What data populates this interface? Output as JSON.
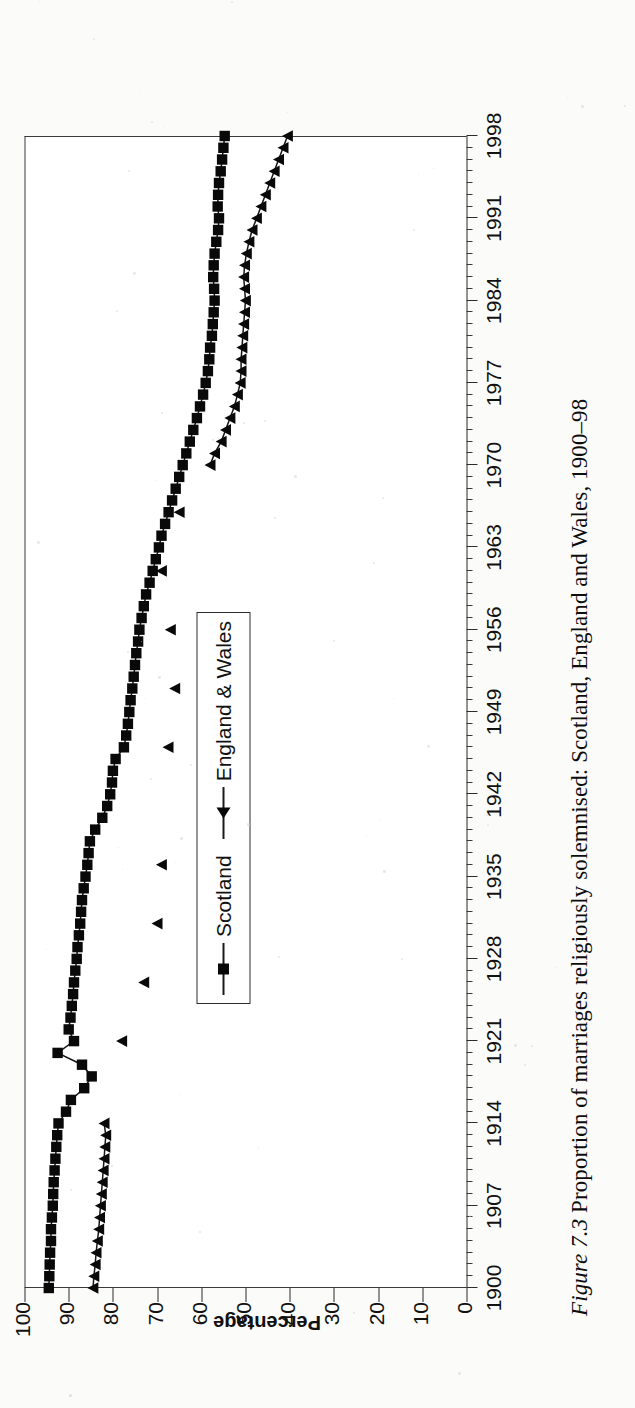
{
  "caption": {
    "figure_label": "Figure 7.3",
    "text": "Proportion of marriages religiously solemnised: Scotland, England and Wales, 1900–98"
  },
  "legend": {
    "position": "inside-center",
    "items": [
      {
        "label": "Scotland",
        "marker": "square-marker"
      },
      {
        "label": "England & Wales",
        "marker": "triangle-marker"
      }
    ]
  },
  "axes": {
    "y_title": "Percentage",
    "y_ticks": [
      "0",
      "10",
      "20",
      "30",
      "40",
      "50",
      "60",
      "70",
      "80",
      "90",
      "100"
    ],
    "x_ticks": [
      "1900",
      "1907",
      "1914",
      "1921",
      "1928",
      "1935",
      "1942",
      "1949",
      "1956",
      "1963",
      "1970",
      "1977",
      "1984",
      "1991",
      "1998"
    ]
  },
  "chart_data": {
    "type": "line",
    "title": "Proportion of marriages religiously solemnised: Scotland, England and Wales, 1900–98",
    "xlabel": "",
    "ylabel": "Percentage",
    "xlim": [
      1900,
      1998
    ],
    "ylim": [
      0,
      100
    ],
    "grid": false,
    "legend_position": "inside-center",
    "x_major_ticks": [
      1900,
      1907,
      1914,
      1921,
      1928,
      1935,
      1942,
      1949,
      1956,
      1963,
      1970,
      1977,
      1984,
      1991,
      1998
    ],
    "x_minor_tick_interval": 1,
    "y_ticks": [
      0,
      10,
      20,
      30,
      40,
      50,
      60,
      70,
      80,
      90,
      100
    ],
    "series": [
      {
        "name": "Scotland",
        "marker": "square",
        "points": [
          [
            1900,
            94.5
          ],
          [
            1901,
            94.4
          ],
          [
            1902,
            94.3
          ],
          [
            1903,
            94.2
          ],
          [
            1904,
            94.0
          ],
          [
            1905,
            94.0
          ],
          [
            1906,
            93.8
          ],
          [
            1907,
            93.6
          ],
          [
            1908,
            93.5
          ],
          [
            1909,
            93.4
          ],
          [
            1910,
            93.2
          ],
          [
            1911,
            93.0
          ],
          [
            1912,
            92.8
          ],
          [
            1913,
            92.6
          ],
          [
            1914,
            92.3
          ],
          [
            1915,
            90.6
          ],
          [
            1916,
            89.5
          ],
          [
            1917,
            86.5
          ],
          [
            1918,
            84.8
          ],
          [
            1919,
            87.0
          ],
          [
            1920,
            92.5
          ],
          [
            1921,
            88.8
          ],
          [
            1922,
            90.0
          ],
          [
            1923,
            89.6
          ],
          [
            1924,
            89.3
          ],
          [
            1925,
            89.0
          ],
          [
            1926,
            88.8
          ],
          [
            1927,
            88.5
          ],
          [
            1928,
            88.2
          ],
          [
            1929,
            88.0
          ],
          [
            1930,
            87.7
          ],
          [
            1931,
            87.4
          ],
          [
            1932,
            87.2
          ],
          [
            1933,
            87.0
          ],
          [
            1934,
            86.6
          ],
          [
            1935,
            86.2
          ],
          [
            1936,
            85.8
          ],
          [
            1937,
            85.5
          ],
          [
            1938,
            85.2
          ],
          [
            1939,
            84.0
          ],
          [
            1940,
            82.4
          ],
          [
            1941,
            81.3
          ],
          [
            1942,
            80.6
          ],
          [
            1943,
            80.2
          ],
          [
            1944,
            80.0
          ],
          [
            1945,
            79.4
          ],
          [
            1946,
            77.5
          ],
          [
            1947,
            77.0
          ],
          [
            1948,
            76.6
          ],
          [
            1949,
            76.3
          ],
          [
            1950,
            76.0
          ],
          [
            1951,
            75.6
          ],
          [
            1952,
            75.3
          ],
          [
            1953,
            75.0
          ],
          [
            1954,
            74.7
          ],
          [
            1955,
            74.3
          ],
          [
            1956,
            74.0
          ],
          [
            1957,
            73.5
          ],
          [
            1958,
            73.0
          ],
          [
            1959,
            72.5
          ],
          [
            1960,
            71.7
          ],
          [
            1961,
            71.0
          ],
          [
            1962,
            70.3
          ],
          [
            1963,
            69.6
          ],
          [
            1964,
            69.0
          ],
          [
            1965,
            68.2
          ],
          [
            1966,
            67.4
          ],
          [
            1967,
            66.6
          ],
          [
            1968,
            65.8
          ],
          [
            1969,
            65.0
          ],
          [
            1970,
            64.2
          ],
          [
            1971,
            63.4
          ],
          [
            1972,
            62.6
          ],
          [
            1973,
            61.8
          ],
          [
            1974,
            61.0
          ],
          [
            1975,
            60.3
          ],
          [
            1976,
            59.6
          ],
          [
            1977,
            59.0
          ],
          [
            1978,
            58.5
          ],
          [
            1979,
            58.2
          ],
          [
            1980,
            58.0
          ],
          [
            1981,
            57.6
          ],
          [
            1982,
            57.4
          ],
          [
            1983,
            57.2
          ],
          [
            1984,
            57.0
          ],
          [
            1985,
            57.1
          ],
          [
            1986,
            57.3
          ],
          [
            1987,
            57.2
          ],
          [
            1988,
            57.0
          ],
          [
            1989,
            56.6
          ],
          [
            1990,
            56.2
          ],
          [
            1991,
            56.0
          ],
          [
            1992,
            56.3
          ],
          [
            1993,
            56.2
          ],
          [
            1994,
            56.0
          ],
          [
            1995,
            55.6
          ],
          [
            1996,
            55.3
          ],
          [
            1997,
            55.0
          ],
          [
            1998,
            54.7
          ]
        ]
      },
      {
        "name": "England & Wales",
        "marker": "triangle",
        "points": [
          [
            1900,
            84.5
          ],
          [
            1901,
            84.3
          ],
          [
            1902,
            84.0
          ],
          [
            1903,
            83.8
          ],
          [
            1904,
            83.5
          ],
          [
            1905,
            83.2
          ],
          [
            1906,
            83.0
          ],
          [
            1907,
            82.8
          ],
          [
            1908,
            82.6
          ],
          [
            1909,
            82.4
          ],
          [
            1910,
            82.2
          ],
          [
            1911,
            82.0
          ],
          [
            1912,
            81.8
          ],
          [
            1913,
            81.6
          ],
          [
            1914,
            82.0
          ],
          [
            1921,
            78.0
          ],
          [
            1926,
            73.0
          ],
          [
            1931,
            70.0
          ],
          [
            1936,
            69.0
          ],
          [
            1946,
            67.5
          ],
          [
            1951,
            66.0
          ],
          [
            1956,
            67.0
          ],
          [
            1961,
            69.0
          ],
          [
            1966,
            65.0
          ],
          [
            1970,
            58.0
          ],
          [
            1971,
            57.0
          ],
          [
            1972,
            55.5
          ],
          [
            1973,
            54.5
          ],
          [
            1974,
            53.5
          ],
          [
            1975,
            52.5
          ],
          [
            1976,
            51.8
          ],
          [
            1977,
            51.2
          ],
          [
            1978,
            51.0
          ],
          [
            1979,
            51.0
          ],
          [
            1980,
            50.8
          ],
          [
            1981,
            50.6
          ],
          [
            1982,
            50.4
          ],
          [
            1983,
            50.2
          ],
          [
            1984,
            50.0
          ],
          [
            1985,
            50.2
          ],
          [
            1986,
            50.4
          ],
          [
            1987,
            50.2
          ],
          [
            1988,
            49.8
          ],
          [
            1989,
            49.2
          ],
          [
            1990,
            48.5
          ],
          [
            1991,
            47.5
          ],
          [
            1992,
            46.5
          ],
          [
            1993,
            45.5
          ],
          [
            1994,
            44.5
          ],
          [
            1995,
            43.5
          ],
          [
            1996,
            42.5
          ],
          [
            1997,
            41.5
          ],
          [
            1998,
            40.5
          ]
        ]
      }
    ]
  }
}
